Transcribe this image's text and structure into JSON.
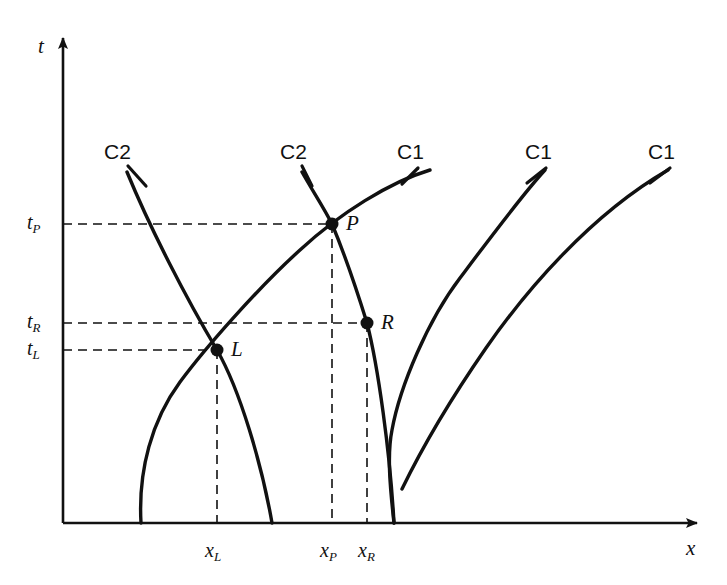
{
  "figure": {
    "type": "diagram",
    "background_color": "#ffffff",
    "ink_color": "#111111"
  },
  "axes": {
    "x_axis": {
      "label": "x",
      "label_pos": {
        "x": 686,
        "y": 538
      },
      "line": {
        "x1": 63,
        "y1": 523,
        "x2": 697,
        "y2": 523
      },
      "arrow": "right"
    },
    "y_axis": {
      "label": "t",
      "label_pos": {
        "x": 38,
        "y": 36
      },
      "line": {
        "x1": 63,
        "y1": 523,
        "x2": 63,
        "y2": 38
      },
      "arrow": "up"
    }
  },
  "ticks": {
    "y": [
      {
        "id": "tP",
        "base": "t",
        "sub": "P",
        "value_y": 224,
        "label_pos": {
          "x": 27,
          "y": 212
        }
      },
      {
        "id": "tR",
        "base": "t",
        "sub": "R",
        "value_y": 323,
        "label_pos": {
          "x": 27,
          "y": 311
        }
      },
      {
        "id": "tL",
        "base": "t",
        "sub": "L",
        "value_y": 350,
        "label_pos": {
          "x": 27,
          "y": 338
        }
      }
    ],
    "x": [
      {
        "id": "xL",
        "base": "x",
        "sub": "L",
        "value_x": 217,
        "label_pos": {
          "x": 205,
          "y": 540
        }
      },
      {
        "id": "xP",
        "base": "x",
        "sub": "P",
        "value_x": 332,
        "label_pos": {
          "x": 320,
          "y": 540
        }
      },
      {
        "id": "xR",
        "base": "x",
        "sub": "R",
        "value_x": 367,
        "label_pos": {
          "x": 358,
          "y": 540
        }
      }
    ]
  },
  "curve_labels": [
    {
      "text": "C2",
      "x": 104,
      "y": 141,
      "leader": {
        "x1": 128,
        "y1": 166,
        "x2": 146,
        "y2": 186
      }
    },
    {
      "text": "C2",
      "x": 280,
      "y": 141,
      "leader": {
        "x1": 302,
        "y1": 166,
        "x2": 312,
        "y2": 186
      }
    },
    {
      "text": "C1",
      "x": 397,
      "y": 141,
      "leader": {
        "x1": 418,
        "y1": 168,
        "x2": 402,
        "y2": 184
      }
    },
    {
      "text": "C1",
      "x": 525,
      "y": 141,
      "leader": {
        "x1": 546,
        "y1": 168,
        "x2": 527,
        "y2": 183
      }
    },
    {
      "text": "C1",
      "x": 648,
      "y": 141,
      "leader": {
        "x1": 670,
        "y1": 168,
        "x2": 650,
        "y2": 183
      }
    }
  ],
  "points": [
    {
      "name": "P",
      "x": 332,
      "y": 224,
      "label_pos": {
        "x": 346,
        "y": 213
      }
    },
    {
      "name": "R",
      "x": 367,
      "y": 323,
      "label_pos": {
        "x": 381,
        "y": 312
      }
    },
    {
      "name": "L",
      "x": 217,
      "y": 350,
      "label_pos": {
        "x": 231,
        "y": 339
      }
    }
  ],
  "curves": [
    {
      "family": "C1",
      "id": "c1-a",
      "path": "M 141 523 C 138 470 152 420 180 382 C 206 347 258 288 300 250 C 340 213 390 182 430 170",
      "note": "leftmost C1 characteristic; passes through L and P"
    },
    {
      "family": "C2",
      "id": "c2-a",
      "path": "M 127 172 C 150 228 186 298 217 350 C 240 390 262 465 272 523",
      "note": "leftmost C2 characteristic; passes through L"
    },
    {
      "family": "C2",
      "id": "c2-b",
      "path": "M 302 172 C 312 190 324 208 332 224 C 345 255 358 294 367 323 C 378 366 390 452 394 523",
      "note": "second C2 characteristic; passes through P and R"
    },
    {
      "family": "C1",
      "id": "c1-b",
      "path": "M 394 523 C 390 487 387 455 392 430 C 400 386 428 320 460 278 C 490 238 522 195 545 170",
      "note": "second C1 characteristic; passes through R"
    },
    {
      "family": "C1",
      "id": "c1-c",
      "path": "M 402 489 C 420 452 450 400 486 348 C 525 292 590 215 668 170",
      "note": "rightmost C1 characteristic"
    }
  ],
  "dashed_guides": [
    {
      "id": "tP-horizontal",
      "x1": 63,
      "y1": 224,
      "x2": 332,
      "y2": 224
    },
    {
      "id": "tR-horizontal",
      "x1": 63,
      "y1": 323,
      "x2": 367,
      "y2": 323
    },
    {
      "id": "tL-horizontal",
      "x1": 63,
      "y1": 350,
      "x2": 217,
      "y2": 350
    },
    {
      "id": "xL-vertical",
      "x1": 217,
      "y1": 350,
      "x2": 217,
      "y2": 523
    },
    {
      "id": "xP-vertical",
      "x1": 332,
      "y1": 224,
      "x2": 332,
      "y2": 523
    },
    {
      "id": "xR-vertical",
      "x1": 367,
      "y1": 323,
      "x2": 367,
      "y2": 523
    }
  ]
}
